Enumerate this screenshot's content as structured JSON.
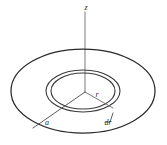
{
  "figure": {
    "kind": "physics-diagram",
    "background_color": "#ffffff",
    "stroke_color": "#2a2a2a",
    "axis_color": "#9a9a9a",
    "labels": {
      "z_axis": "z",
      "radius_element": "r",
      "disc_radius": "a",
      "ring_width": "dr"
    },
    "geometry": {
      "disc": {
        "center_x": 83,
        "center_y": 91,
        "radius_x": 72,
        "radius_y": 42
      },
      "ring_outer": {
        "center_x": 83,
        "center_y": 91,
        "radius_x": 37,
        "radius_y": 21
      },
      "ring_inner": {
        "center_x": 83,
        "center_y": 91,
        "radius_x": 32,
        "radius_y": 18
      },
      "z_axis": {
        "x": 85,
        "y_top": 12,
        "y_bottom": 92
      },
      "origin": {
        "x": 85,
        "y": 92
      },
      "radius_line_r": {
        "x1": 85,
        "y1": 92,
        "x2": 113,
        "y2": 108
      },
      "radius_line_a": {
        "x1": 85,
        "y1": 92,
        "x2": 33,
        "y2": 128
      },
      "dr_leader": {
        "x1": 105,
        "y1": 122,
        "x2": 113,
        "y2": 113
      }
    },
    "label_positions": {
      "z": {
        "x": 86,
        "y": 10
      },
      "r": {
        "x": 97,
        "y": 97
      },
      "a": {
        "x": 47,
        "y": 125
      },
      "dr": {
        "x": 108,
        "y": 125
      }
    }
  }
}
